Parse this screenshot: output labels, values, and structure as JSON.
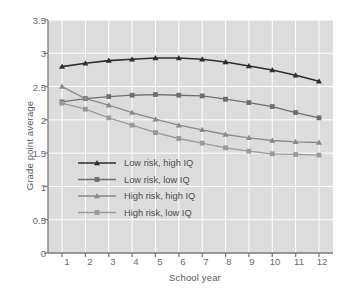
{
  "chart_data": {
    "type": "line",
    "title": "",
    "xlabel": "School year",
    "ylabel": "Grade point average",
    "xlim": [
      0.4,
      12.6
    ],
    "ylim": [
      0,
      3.5
    ],
    "grid": true,
    "legend_position": "center-left-inside",
    "x": [
      1,
      2,
      3,
      4,
      5,
      6,
      7,
      8,
      9,
      10,
      11,
      12
    ],
    "xticks": [
      "1",
      "2",
      "3",
      "4",
      "5",
      "6",
      "7",
      "8",
      "9",
      "10",
      "11",
      "12"
    ],
    "yticks": [
      "0",
      "0.5",
      "1",
      "1.5",
      "2",
      "2.5",
      "3",
      "3.5"
    ],
    "ytick_values": [
      0,
      0.5,
      1,
      1.5,
      2,
      2.5,
      3,
      3.5
    ],
    "series": [
      {
        "name": "Low risk, high IQ",
        "marker": "triangle",
        "color": "#2e2e30",
        "values": [
          2.8,
          2.85,
          2.89,
          2.91,
          2.93,
          2.93,
          2.91,
          2.87,
          2.81,
          2.75,
          2.67,
          2.58
        ]
      },
      {
        "name": "Low risk, low IQ",
        "marker": "square",
        "color": "#6e6e70",
        "values": [
          2.27,
          2.32,
          2.35,
          2.37,
          2.38,
          2.37,
          2.36,
          2.31,
          2.26,
          2.2,
          2.11,
          2.03
        ]
      },
      {
        "name": "High risk, high IQ",
        "marker": "triangle",
        "color": "#8a8a8c",
        "values": [
          2.5,
          2.32,
          2.22,
          2.11,
          2.01,
          1.92,
          1.85,
          1.78,
          1.73,
          1.69,
          1.67,
          1.66
        ]
      },
      {
        "name": "High risk, low IQ",
        "marker": "square",
        "color": "#9a9a9c",
        "values": [
          2.25,
          2.16,
          2.03,
          1.92,
          1.81,
          1.72,
          1.65,
          1.58,
          1.53,
          1.49,
          1.48,
          1.47
        ]
      }
    ],
    "plot_background": "#dcdcdc",
    "grid_color": "#ffffff",
    "axis_color": "#7a7a7c"
  }
}
